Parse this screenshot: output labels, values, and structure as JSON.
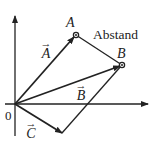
{
  "diagram": {
    "labels": {
      "point_a": "A",
      "point_b": "B",
      "distance": "Abstand",
      "origin": "0",
      "vector_a": "A",
      "vector_b": "B",
      "vector_c": "C",
      "vector_arrow": "→"
    },
    "colors": {
      "stroke": "#222222",
      "background": "#ffffff"
    }
  }
}
